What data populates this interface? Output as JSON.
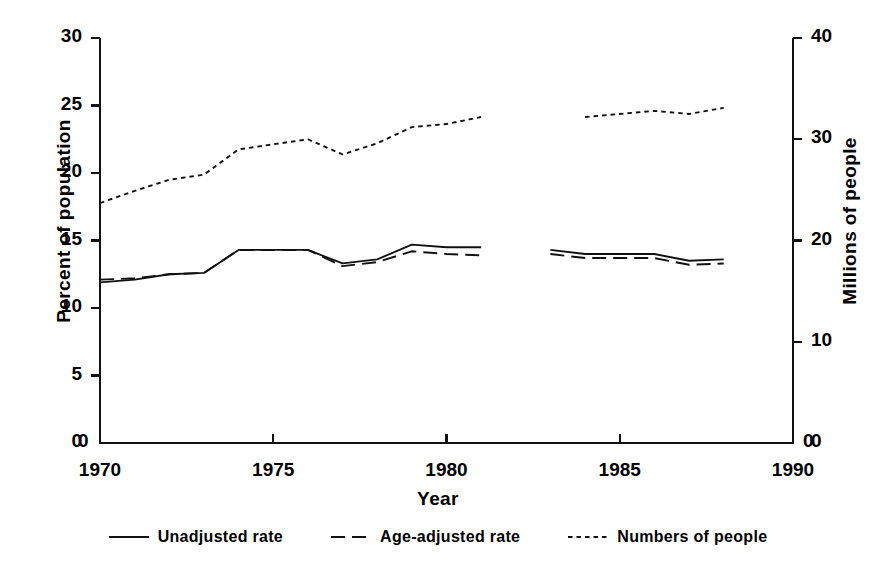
{
  "chart_data": {
    "type": "line",
    "title": "",
    "xlabel": "Year",
    "ylabel": "Percent of population",
    "ylabel_right": "Millions of people",
    "xlim": [
      1970,
      1990
    ],
    "ylim": [
      0,
      30
    ],
    "ylim_right": [
      0,
      40
    ],
    "grid": false,
    "legend_position": "bottom",
    "xticks": [
      "1970",
      "1975",
      "1980",
      "1985",
      "1990"
    ],
    "xtick_values": [
      1970,
      1975,
      1980,
      1985,
      1990
    ],
    "yticks_left": [
      "0",
      "5",
      "10",
      "15",
      "20",
      "25",
      "30"
    ],
    "ytick_values_left": [
      0,
      5,
      10,
      15,
      20,
      25,
      30
    ],
    "yticks_right": [
      "0",
      "10",
      "20",
      "30",
      "40"
    ],
    "ytick_values_right": [
      0,
      10,
      20,
      30,
      40
    ],
    "series": [
      {
        "name": "Unadjusted rate",
        "style": "solid",
        "axis": "left",
        "segments": [
          {
            "x": [
              1970,
              1971,
              1972,
              1973,
              1974,
              1975,
              1976,
              1977,
              1978,
              1979,
              1980,
              1981
            ],
            "y": [
              11.9,
              12.1,
              12.5,
              12.6,
              14.3,
              14.3,
              14.3,
              13.3,
              13.6,
              14.7,
              14.5,
              14.5
            ]
          },
          {
            "x": [
              1983,
              1984,
              1985,
              1986,
              1987,
              1988
            ],
            "y": [
              14.3,
              14.0,
              14.0,
              14.0,
              13.5,
              13.6
            ]
          }
        ]
      },
      {
        "name": "Age-adjusted rate",
        "style": "dashed",
        "axis": "left",
        "segments": [
          {
            "x": [
              1970,
              1971,
              1972,
              1973,
              1974,
              1975,
              1976,
              1977,
              1978,
              1979,
              1980,
              1981
            ],
            "y": [
              12.1,
              12.2,
              12.5,
              12.6,
              14.3,
              14.3,
              14.3,
              13.1,
              13.4,
              14.2,
              14.0,
              13.9
            ]
          },
          {
            "x": [
              1983,
              1984,
              1985,
              1986,
              1987,
              1988
            ],
            "y": [
              14.0,
              13.7,
              13.7,
              13.7,
              13.2,
              13.3
            ]
          }
        ]
      },
      {
        "name": "Numbers of people",
        "style": "dotted",
        "axis": "right",
        "segments": [
          {
            "x": [
              1970,
              1971,
              1972,
              1973,
              1974,
              1975,
              1976,
              1977,
              1978,
              1979,
              1980,
              1981
            ],
            "y": [
              23.7,
              24.9,
              26.0,
              26.5,
              29.0,
              29.5,
              30.0,
              28.5,
              29.6,
              31.2,
              31.5,
              32.2
            ]
          },
          {
            "x": [
              1984,
              1985,
              1986,
              1987,
              1988
            ],
            "y": [
              32.2,
              32.5,
              32.8,
              32.5,
              33.1
            ]
          }
        ]
      }
    ]
  },
  "legend": {
    "items": [
      {
        "label": "Unadjusted rate",
        "style": "solid"
      },
      {
        "label": "Age-adjusted rate",
        "style": "dashed"
      },
      {
        "label": "Numbers of people",
        "style": "dotted"
      }
    ]
  },
  "colors": {
    "ink": "#111111",
    "background": "#ffffff"
  }
}
